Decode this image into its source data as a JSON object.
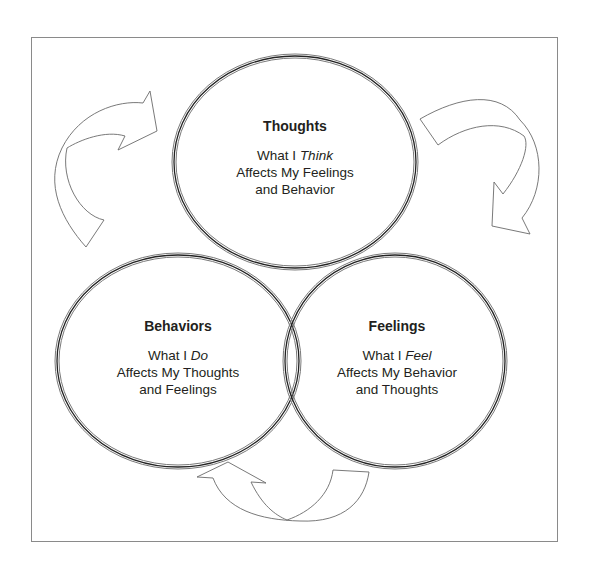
{
  "diagram": {
    "type": "cycle",
    "colors": {
      "outline": "#3a3a3a",
      "frame": "#8a8a8a",
      "text": "#231f20"
    },
    "nodes": [
      {
        "id": "thoughts",
        "title": "Thoughts",
        "line1_prefix": "What I ",
        "line1_emphasis": "Think",
        "line2": "Affects My Feelings",
        "line3": "and Behavior"
      },
      {
        "id": "behaviors",
        "title": "Behaviors",
        "line1_prefix": "What I ",
        "line1_emphasis": "Do",
        "line2": "Affects My Thoughts",
        "line3": "and Feelings"
      },
      {
        "id": "feelings",
        "title": "Feelings",
        "line1_prefix": "What I ",
        "line1_emphasis": "Feel",
        "line2": "Affects My Behavior",
        "line3": "and Thoughts"
      }
    ],
    "arrows": [
      {
        "from": "behaviors",
        "to": "thoughts",
        "position": "upper-left"
      },
      {
        "from": "thoughts",
        "to": "feelings",
        "position": "upper-right"
      },
      {
        "from": "feelings",
        "to": "behaviors",
        "position": "bottom"
      }
    ]
  }
}
